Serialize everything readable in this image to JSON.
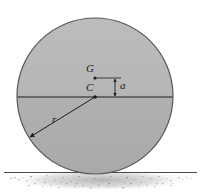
{
  "figure": {
    "background_color": "#ffffff",
    "width": 201,
    "height": 194
  },
  "labels": {
    "mass_center": "G",
    "geometric_center": "C",
    "offset_distance": "a",
    "radius": "r"
  },
  "colors": {
    "body_fill": "#b4b4b4",
    "body_fill_lower": "#b0b0b0",
    "body_edge": "#555555",
    "line": "#1c1c1c",
    "ground_line": "#4a4a4a",
    "shadow": "#bdbdbd",
    "label_text": "#1c1c1c"
  },
  "geometry": {
    "circle": {
      "cx": 95,
      "cy": 96,
      "r": 78
    },
    "point_C": {
      "x": 95,
      "y": 97
    },
    "point_G": {
      "x": 95,
      "y": 78
    },
    "dimension_line_x": 115,
    "dimension_top_y": 78,
    "dimension_bottom_y": 97,
    "radius_arrow_start": {
      "x": 95,
      "y": 97
    },
    "radius_arrow_end": {
      "x": 29,
      "y": 138
    },
    "ground_y": 172,
    "diameter_line_y": 97
  },
  "shadow_speckles": [
    [
      30,
      176
    ],
    [
      38,
      179
    ],
    [
      46,
      175
    ],
    [
      54,
      180
    ],
    [
      62,
      177
    ],
    [
      70,
      181
    ],
    [
      78,
      176
    ],
    [
      86,
      180
    ],
    [
      94,
      178
    ],
    [
      102,
      181
    ],
    [
      110,
      176
    ],
    [
      118,
      180
    ],
    [
      126,
      177
    ],
    [
      134,
      179
    ],
    [
      142,
      176
    ],
    [
      150,
      178
    ],
    [
      158,
      176
    ],
    [
      166,
      178
    ],
    [
      34,
      183
    ],
    [
      50,
      184
    ],
    [
      66,
      183
    ],
    [
      82,
      185
    ],
    [
      98,
      184
    ],
    [
      114,
      185
    ],
    [
      130,
      183
    ],
    [
      146,
      184
    ],
    [
      162,
      183
    ],
    [
      26,
      180
    ],
    [
      170,
      180
    ],
    [
      22,
      177
    ],
    [
      178,
      177
    ],
    [
      42,
      186
    ],
    [
      58,
      187
    ],
    [
      74,
      186
    ],
    [
      90,
      187
    ],
    [
      106,
      186
    ],
    [
      122,
      187
    ],
    [
      138,
      186
    ],
    [
      154,
      186
    ],
    [
      170,
      185
    ],
    [
      18,
      179
    ],
    [
      182,
      179
    ],
    [
      14,
      177
    ],
    [
      186,
      177
    ],
    [
      44,
      182
    ],
    [
      60,
      182
    ],
    [
      76,
      183
    ],
    [
      92,
      182
    ],
    [
      108,
      183
    ],
    [
      124,
      182
    ],
    [
      140,
      182
    ],
    [
      156,
      183
    ],
    [
      28,
      185
    ],
    [
      172,
      183
    ],
    [
      10,
      178
    ],
    [
      190,
      178
    ]
  ]
}
